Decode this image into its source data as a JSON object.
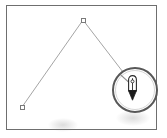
{
  "app": {
    "title": "Vector path editor canvas",
    "tool_in_use": "pen-tool"
  },
  "canvas": {
    "name": "drawing-canvas",
    "border_color": "#6e6e6e",
    "background_color": "#ffffff",
    "width": 151,
    "height": 125
  },
  "path": {
    "name": "open-path",
    "stroke_color": "#8f8f8f",
    "stroke_width": 1,
    "segments": [
      {
        "from": [
          20,
          105
        ],
        "to": [
          81,
          18
        ]
      },
      {
        "from": [
          81,
          18
        ],
        "to": [
          135,
          88
        ]
      }
    ]
  },
  "anchors": [
    {
      "name": "anchor-point-apex",
      "label": "apex anchor point",
      "x": 81,
      "y": 18,
      "state": "selected",
      "fill": "#ffffff",
      "stroke": "#7a7a7a"
    },
    {
      "name": "anchor-point-start",
      "label": "start anchor point",
      "x": 20,
      "y": 105,
      "state": "selected",
      "fill": "#ffffff",
      "stroke": "#7a7a7a"
    }
  ],
  "callout": {
    "name": "magnifier-callout",
    "label": "magnified detail",
    "shape": "circle",
    "x": 112,
    "y": 67,
    "diameter": 46,
    "ring_color": "#585858",
    "contents": "pen-tool-cursor"
  },
  "cursor": {
    "name": "pen-tool-cursor",
    "icon": "pen-nib-icon",
    "label": "Pen tool",
    "tip_color": "#1c1c1c",
    "body_color": "#ffffff",
    "outline_color": "#2b2b2b"
  }
}
